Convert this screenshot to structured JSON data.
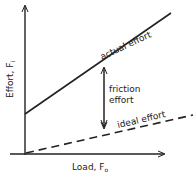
{
  "diagram": {
    "title": "",
    "y_axis": {
      "label": "Effort, F",
      "subscript": "i"
    },
    "x_axis": {
      "label": "Load, F",
      "subscript": "o"
    },
    "lines": [
      {
        "name": "actual effort",
        "label": "actual effort",
        "style": "solid"
      },
      {
        "name": "ideal effort",
        "label": "ideal effort",
        "style": "dashed"
      }
    ],
    "annotation": {
      "line1": "friction",
      "line2": "effort"
    }
  }
}
